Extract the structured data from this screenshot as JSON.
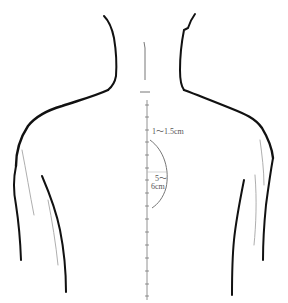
{
  "diagram": {
    "colors": {
      "outline": "#111111",
      "guide": "#777777",
      "background": "#ffffff"
    },
    "annotations": {
      "upper_distance": "1～1.5cm",
      "arc_distance_line1": "5～",
      "arc_distance_line2": "6cm"
    }
  }
}
